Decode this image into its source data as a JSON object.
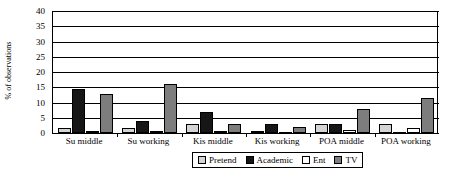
{
  "chart_data": {
    "type": "bar",
    "title": "",
    "xlabel": "",
    "ylabel": "% of observations",
    "ylim": [
      0,
      40
    ],
    "ytick_step": 5,
    "yticks": [
      40,
      35,
      30,
      25,
      20,
      15,
      10,
      5,
      0
    ],
    "grid": true,
    "legend_position": "bottom",
    "categories": [
      "Su middle",
      "Su working",
      "Kis middle",
      "Kis working",
      "POA middle",
      "POA working"
    ],
    "series": [
      {
        "name": "Pretend",
        "color": "#d4d4d4",
        "values": [
          1.5,
          1.5,
          3.0,
          0.5,
          3.0,
          3.0
        ]
      },
      {
        "name": "Academic",
        "color": "#161616",
        "values": [
          14.5,
          4.0,
          7.0,
          3.0,
          3.0,
          0.0
        ]
      },
      {
        "name": "Ent",
        "color": "#ffffff",
        "values": [
          0.5,
          0.5,
          0.5,
          0.0,
          1.0,
          1.5
        ]
      },
      {
        "name": "TV",
        "color": "#7d7d7d",
        "values": [
          12.8,
          16.0,
          3.0,
          2.0,
          8.0,
          11.5
        ]
      }
    ]
  },
  "legend": {
    "items": [
      {
        "label": "Pretend",
        "key": "pretend"
      },
      {
        "label": "Academic",
        "key": "academic"
      },
      {
        "label": "Ent",
        "key": "ent"
      },
      {
        "label": "TV",
        "key": "tv"
      }
    ]
  },
  "colors": {
    "pretend": "#d4d4d4",
    "academic": "#161616",
    "ent": "#ffffff",
    "tv": "#7d7d7d",
    "axis": "#000000",
    "background": "#ffffff"
  }
}
